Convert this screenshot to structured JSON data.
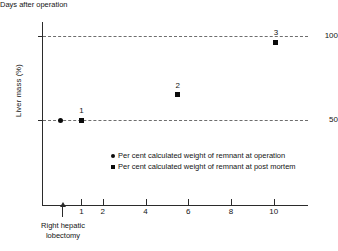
{
  "chart_data": {
    "type": "scatter",
    "title": "",
    "xlabel": "Days after operation",
    "ylabel": "Liver mass (%)",
    "xlim": [
      -0.8,
      11.6
    ],
    "ylim": [
      0,
      108
    ],
    "grid": "horizontal dashed gridlines at y = 50 and y = 100",
    "legend_position": "inside-center",
    "x_ticks": [
      {
        "value": 1,
        "label": "1"
      },
      {
        "value": 2,
        "label": "2"
      },
      {
        "value": 4,
        "label": "4"
      },
      {
        "value": 6,
        "label": "6"
      },
      {
        "value": 8,
        "label": "8"
      },
      {
        "value": 10,
        "label": "10"
      }
    ],
    "y_ticks": [
      {
        "value": 50,
        "label": "50"
      },
      {
        "value": 100,
        "label": "100"
      }
    ],
    "gridlines": [
      50,
      100
    ],
    "series": [
      {
        "name": "Per cent calculated weight of remnant at operation",
        "marker": "circle",
        "points": [
          {
            "x": 0,
            "y": 50,
            "label": ""
          }
        ]
      },
      {
        "name": "Per cent calculated weight of remnant at post mortem",
        "marker": "square",
        "points": [
          {
            "x": 1,
            "y": 50,
            "label": "1"
          },
          {
            "x": 5.5,
            "y": 65,
            "label": "2"
          },
          {
            "x": 10.1,
            "y": 96,
            "label": "3"
          }
        ]
      }
    ],
    "annotations": [
      {
        "name": "operation-marker",
        "x": 0,
        "text_line1": "Right hepatic",
        "text_line2": "lobectomy",
        "arrow": "up"
      }
    ]
  },
  "legend": {
    "items": [
      {
        "marker": "circle",
        "label": "Per cent calculated weight of remnant at operation"
      },
      {
        "marker": "square",
        "label": "Per cent calculated weight of remnant at post mortem"
      }
    ]
  },
  "axis_titles": {
    "y": "Liver mass (%)",
    "x": "Days after operation"
  },
  "operation_annotation": {
    "line1": "Right hepatic",
    "line2": "lobectomy"
  }
}
